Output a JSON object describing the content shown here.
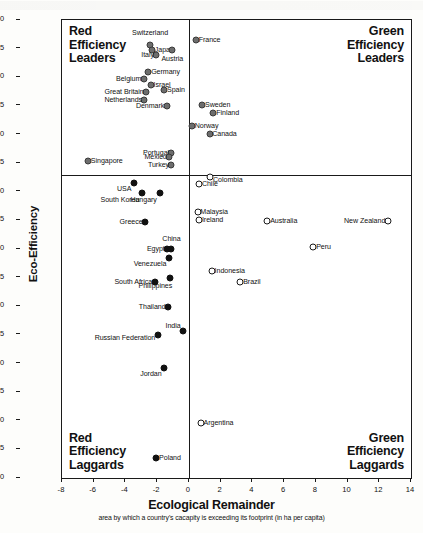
{
  "chart_data": {
    "type": "scatter",
    "title": "",
    "xlabel": "Ecological Remainder",
    "xsublabel": "area by which a country's cacapity is exceeding its footprint (in ha per capita)",
    "ylabel": "Eco-Efficiency",
    "ysublabel": "ha footprint per 1000 USD GDP (measured in purchasing-power-adjusted 1993 US dollars)",
    "xlim": [
      -8,
      14
    ],
    "ylim": [
      0.2,
      1.0
    ],
    "y_inverted": true,
    "grid": false,
    "legend": "none",
    "xticks": [
      "-8",
      "-6",
      "-4",
      "-2",
      "0",
      "2",
      "4",
      "6",
      "8",
      "10",
      "12",
      "14"
    ],
    "xtick_values": [
      -8,
      -6,
      -4,
      -2,
      0,
      2,
      4,
      6,
      8,
      10,
      12,
      14
    ],
    "yticks": [
      "0.20",
      "0.25",
      "0.30",
      "0.35",
      "0.40",
      "0.45",
      "0.50",
      "0.55",
      "0.60",
      "0.65",
      "0.70",
      "0.75",
      "0.80",
      "0.85",
      "0.90",
      "0.95",
      "1.00"
    ],
    "ytick_values": [
      0.2,
      0.25,
      0.3,
      0.35,
      0.4,
      0.45,
      0.5,
      0.55,
      0.6,
      0.65,
      0.7,
      0.75,
      0.8,
      0.85,
      0.9,
      0.95,
      1.0
    ],
    "divider_x": 0,
    "divider_y": 0.47,
    "quadrants": {
      "top_left": [
        "Red",
        "Efficiency",
        "Leaders"
      ],
      "top_right": [
        "Green",
        "Efficiency",
        "Leaders"
      ],
      "bottom_left": [
        "Red",
        "Efficiency",
        "Laggards"
      ],
      "bottom_right": [
        "Green",
        "Efficiency",
        "Laggards"
      ]
    },
    "points": [
      {
        "name": "Switzerland",
        "x": -2.45,
        "y": 0.243,
        "marker": "gray",
        "side": "c",
        "lx": -2.45,
        "ly": 0.222
      },
      {
        "name": "Japan",
        "x": -2.3,
        "y": 0.252,
        "marker": "gray",
        "side": "r",
        "lx": -2.15,
        "ly": 0.252
      },
      {
        "name": "Italy",
        "x": -2.05,
        "y": 0.262,
        "marker": "gray",
        "side": "l",
        "lx": -2.2,
        "ly": 0.262
      },
      {
        "name": "Austria",
        "x": -1.05,
        "y": 0.252,
        "marker": "gray",
        "side": "c",
        "lx": -1.05,
        "ly": 0.268
      },
      {
        "name": "France",
        "x": 0.45,
        "y": 0.235,
        "marker": "gray",
        "side": "r",
        "lx": 0.62,
        "ly": 0.235
      },
      {
        "name": "Germany",
        "x": -2.55,
        "y": 0.291,
        "marker": "gray",
        "side": "r",
        "lx": -2.38,
        "ly": 0.291
      },
      {
        "name": "Belgium",
        "x": -2.85,
        "y": 0.303,
        "marker": "gray",
        "side": "l",
        "lx": -3.0,
        "ly": 0.303
      },
      {
        "name": "Israel",
        "x": -2.4,
        "y": 0.313,
        "marker": "gray",
        "side": "r",
        "lx": -2.23,
        "ly": 0.313
      },
      {
        "name": "Great Britain",
        "x": -2.7,
        "y": 0.326,
        "marker": "gray",
        "side": "l",
        "lx": -2.85,
        "ly": 0.326
      },
      {
        "name": "Spain",
        "x": -1.55,
        "y": 0.323,
        "marker": "gray",
        "side": "r",
        "lx": -1.38,
        "ly": 0.323
      },
      {
        "name": "Netherlands",
        "x": -2.8,
        "y": 0.339,
        "marker": "gray",
        "side": "l",
        "lx": -2.95,
        "ly": 0.339
      },
      {
        "name": "Denmark",
        "x": -1.4,
        "y": 0.351,
        "marker": "gray",
        "side": "l",
        "lx": -1.55,
        "ly": 0.351
      },
      {
        "name": "Sweden",
        "x": 0.85,
        "y": 0.348,
        "marker": "gray",
        "side": "r",
        "lx": 1.02,
        "ly": 0.348
      },
      {
        "name": "Finland",
        "x": 1.55,
        "y": 0.362,
        "marker": "gray",
        "side": "r",
        "lx": 1.72,
        "ly": 0.362
      },
      {
        "name": "Norway",
        "x": 0.2,
        "y": 0.385,
        "marker": "gray",
        "side": "r",
        "lx": 0.37,
        "ly": 0.385
      },
      {
        "name": "Canada",
        "x": 1.3,
        "y": 0.399,
        "marker": "gray",
        "side": "r",
        "lx": 1.47,
        "ly": 0.399
      },
      {
        "name": "Portugal",
        "x": -1.1,
        "y": 0.432,
        "marker": "gray",
        "side": "l",
        "lx": -1.25,
        "ly": 0.432
      },
      {
        "name": "Mexico",
        "x": -1.25,
        "y": 0.44,
        "marker": "gray",
        "side": "l",
        "lx": -1.4,
        "ly": 0.44
      },
      {
        "name": "Turkey",
        "x": -1.1,
        "y": 0.453,
        "marker": "gray",
        "side": "l",
        "lx": -1.25,
        "ly": 0.453
      },
      {
        "name": "Singapore",
        "x": -6.35,
        "y": 0.447,
        "marker": "gray",
        "side": "r",
        "lx": -6.18,
        "ly": 0.447
      },
      {
        "name": "USA",
        "x": -3.45,
        "y": 0.484,
        "marker": "filled",
        "side": "l",
        "lx": -3.62,
        "ly": 0.495
      },
      {
        "name": "South Korea",
        "x": -2.95,
        "y": 0.503,
        "marker": "filled",
        "side": "l",
        "lx": -3.12,
        "ly": 0.514
      },
      {
        "name": "Hungary",
        "x": -1.85,
        "y": 0.503,
        "marker": "filled",
        "side": "l",
        "lx": -2.02,
        "ly": 0.514
      },
      {
        "name": "Greece",
        "x": -2.75,
        "y": 0.553,
        "marker": "filled",
        "side": "l",
        "lx": -2.92,
        "ly": 0.553
      },
      {
        "name": "China",
        "x": -1.1,
        "y": 0.6,
        "marker": "filled",
        "side": "c",
        "lx": -1.1,
        "ly": 0.583
      },
      {
        "name": "Egypt",
        "x": -1.35,
        "y": 0.6,
        "marker": "l",
        "side": "l",
        "lx": -1.52,
        "ly": 0.6
      },
      {
        "name": "Venezuela",
        "x": -1.25,
        "y": 0.616,
        "marker": "filled",
        "side": "l",
        "lx": -1.42,
        "ly": 0.627
      },
      {
        "name": "South Africa",
        "x": -2.15,
        "y": 0.657,
        "marker": "filled",
        "side": "l",
        "lx": -2.32,
        "ly": 0.657
      },
      {
        "name": "Philippines",
        "x": -1.2,
        "y": 0.65,
        "marker": "filled",
        "side": "l",
        "lx": -1.05,
        "ly": 0.664
      },
      {
        "name": "Thailand",
        "x": -1.3,
        "y": 0.701,
        "marker": "filled",
        "side": "l",
        "lx": -1.47,
        "ly": 0.701
      },
      {
        "name": "India",
        "x": -0.35,
        "y": 0.744,
        "marker": "filled",
        "side": "l",
        "lx": -0.52,
        "ly": 0.735
      },
      {
        "name": "Russian Federation",
        "x": -1.95,
        "y": 0.75,
        "marker": "filled",
        "side": "l",
        "lx": -2.12,
        "ly": 0.755
      },
      {
        "name": "Jordan",
        "x": -1.55,
        "y": 0.808,
        "marker": "filled",
        "side": "l",
        "lx": -1.72,
        "ly": 0.818
      },
      {
        "name": "Poland",
        "x": -2.05,
        "y": 0.965,
        "marker": "filled",
        "side": "r",
        "lx": -1.88,
        "ly": 0.965
      },
      {
        "name": "Chile",
        "x": 0.65,
        "y": 0.487,
        "marker": "open",
        "side": "r",
        "lx": 0.82,
        "ly": 0.487
      },
      {
        "name": "Colombia",
        "x": 1.35,
        "y": 0.475,
        "marker": "open",
        "side": "r",
        "lx": 1.52,
        "ly": 0.479
      },
      {
        "name": "Malaysia",
        "x": 0.55,
        "y": 0.536,
        "marker": "open",
        "side": "r",
        "lx": 0.72,
        "ly": 0.536
      },
      {
        "name": "Ireland",
        "x": 0.65,
        "y": 0.55,
        "marker": "open",
        "side": "r",
        "lx": 0.82,
        "ly": 0.55
      },
      {
        "name": "Australia",
        "x": 4.95,
        "y": 0.551,
        "marker": "open",
        "side": "r",
        "lx": 5.12,
        "ly": 0.551
      },
      {
        "name": "New Zealand",
        "x": 12.55,
        "y": 0.551,
        "marker": "open",
        "side": "l",
        "lx": 12.38,
        "ly": 0.551
      },
      {
        "name": "Peru",
        "x": 7.85,
        "y": 0.597,
        "marker": "open",
        "side": "r",
        "lx": 8.02,
        "ly": 0.597
      },
      {
        "name": "Indonesia",
        "x": 1.45,
        "y": 0.639,
        "marker": "open",
        "side": "r",
        "lx": 1.62,
        "ly": 0.639
      },
      {
        "name": "Brazil",
        "x": 3.25,
        "y": 0.657,
        "marker": "open",
        "side": "r",
        "lx": 3.42,
        "ly": 0.657
      },
      {
        "name": "Argentina",
        "x": 0.75,
        "y": 0.904,
        "marker": "open",
        "side": "r",
        "lx": 0.92,
        "ly": 0.904
      }
    ]
  }
}
